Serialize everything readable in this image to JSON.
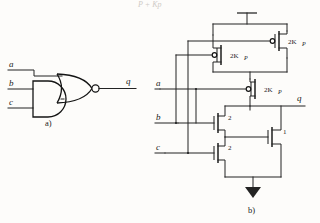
{
  "figure": {
    "page_fragment_top": "P + Kp",
    "part_a": {
      "caption": "a)",
      "inputs": [
        "a",
        "b",
        "c"
      ],
      "output": "q",
      "gates": [
        {
          "name": "and-gate",
          "type": "AND",
          "inputs": [
            "b",
            "c"
          ]
        },
        {
          "name": "nor-gate",
          "type": "NOR",
          "inputs": [
            "a",
            "and-out"
          ],
          "inverting_bubble": true
        }
      ]
    },
    "part_b": {
      "caption": "b)",
      "inputs": [
        "a",
        "b",
        "c"
      ],
      "output": "q",
      "supply_symbol": "vdd-bar",
      "ground_symbol": "ground-triangle",
      "pmos": [
        {
          "name": "pmos-b",
          "gate": "b",
          "size_label": "2K",
          "size_sub": "P"
        },
        {
          "name": "pmos-c",
          "gate": "c",
          "size_label": "2K",
          "size_sub": "P"
        },
        {
          "name": "pmos-a",
          "gate": "a",
          "size_label": "2K",
          "size_sub": "P"
        }
      ],
      "nmos": [
        {
          "name": "nmos-b",
          "gate": "b",
          "size_label": "2"
        },
        {
          "name": "nmos-c",
          "gate": "c",
          "size_label": "2"
        },
        {
          "name": "nmos-a",
          "gate": "a",
          "size_label": "1"
        }
      ]
    }
  },
  "colors": {
    "ink": "#232323",
    "paper": "#fdfcfa",
    "gate_ink": "#141414"
  }
}
